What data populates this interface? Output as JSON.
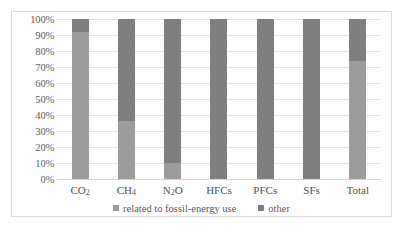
{
  "chart_data": {
    "type": "bar",
    "subtype": "100% stacked column",
    "title": "",
    "xlabel": "",
    "ylabel": "",
    "ylim": [
      0,
      100
    ],
    "yunit": "%",
    "grid": true,
    "legend_position": "bottom",
    "categories": [
      "CO2",
      "CH4",
      "N2O",
      "HFCs",
      "PFCs",
      "SFs",
      "Total"
    ],
    "category_labels": [
      {
        "base": "CO",
        "sub": "2",
        "tail": ""
      },
      {
        "base": "CH",
        "sub": "4",
        "tail": ""
      },
      {
        "base": "N",
        "sub": "2",
        "tail": "O"
      },
      {
        "base": "HFCs",
        "sub": "",
        "tail": ""
      },
      {
        "base": "PFCs",
        "sub": "",
        "tail": ""
      },
      {
        "base": "SFs",
        "sub": "",
        "tail": ""
      },
      {
        "base": "Total",
        "sub": "",
        "tail": ""
      }
    ],
    "y_ticks": [
      "0%",
      "10%",
      "20%",
      "30%",
      "40%",
      "50%",
      "60%",
      "70%",
      "80%",
      "90%",
      "100%"
    ],
    "y_tick_values": [
      0,
      10,
      20,
      30,
      40,
      50,
      60,
      70,
      80,
      90,
      100
    ],
    "series": [
      {
        "name": "related to fossil-energy use",
        "color": "#9c9c9c",
        "values": [
          92,
          36,
          10,
          0,
          0,
          0,
          74
        ]
      },
      {
        "name": "other",
        "color": "#7f7f7f",
        "values": [
          8,
          64,
          90,
          100,
          100,
          100,
          26
        ]
      }
    ]
  },
  "legend": {
    "items": [
      {
        "label": "related to fossil-energy use",
        "color": "#9c9c9c"
      },
      {
        "label": "other",
        "color": "#7f7f7f"
      }
    ]
  },
  "colors": {
    "series_fossil": "#9c9c9c",
    "series_other": "#7f7f7f",
    "gridline": "#e3e3e3",
    "frame": "#d9d9d9",
    "text": "#5a5a5a",
    "background": "#ffffff"
  }
}
